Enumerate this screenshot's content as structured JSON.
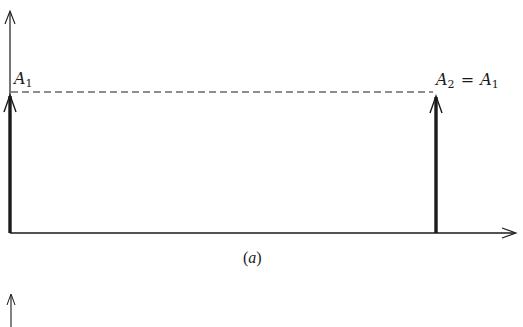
{
  "figure": {
    "panel_a": {
      "caption": "(a)",
      "caption_letter": "a",
      "impulse_1": {
        "symbol": "A",
        "subscript": "1",
        "x": 10,
        "height_y": 92
      },
      "impulse_2": {
        "label_lhs_symbol": "A",
        "label_lhs_subscript": "2",
        "equals": "=",
        "label_rhs_symbol": "A",
        "label_rhs_subscript": "1",
        "x": 436,
        "height_y": 92
      },
      "reference_line": "dashed",
      "axes": {
        "vertical": true,
        "horizontal": true
      }
    },
    "panel_b": {
      "visible": "partial vertical axis arrow only"
    },
    "colors": {
      "ink": "#1a1a1a",
      "background": "#ffffff"
    }
  }
}
